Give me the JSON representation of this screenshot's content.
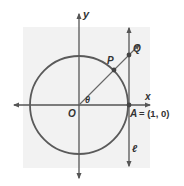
{
  "diagram": {
    "colors": {
      "panel": "#f2f2f2",
      "stroke": "#555555",
      "text": "#333333",
      "background": "#ffffff"
    },
    "labels": {
      "y_axis": "y",
      "x_axis": "x",
      "origin": "O",
      "angle": "θ",
      "point_p": "P",
      "point_q": "Q",
      "point_a": "A",
      "point_a_coords": "= (1, 0)",
      "tangent_line": "ℓ"
    },
    "elements": {
      "circle": {
        "center": [
          79,
          105
        ],
        "radius": 49
      },
      "x_axis": {
        "from": [
          12,
          105
        ],
        "to": [
          152,
          105
        ]
      },
      "y_axis": {
        "from": [
          79,
          180
        ],
        "to": [
          79,
          12
        ]
      },
      "tangent_line_l": {
        "x": 129,
        "from_y": 168,
        "to_y": 26
      },
      "ray_op": {
        "from": [
          79,
          105
        ],
        "to": [
          140,
          44
        ]
      },
      "points": {
        "P": [
          114,
          70
        ],
        "Q": [
          129,
          55
        ],
        "A": [
          129,
          105
        ]
      }
    }
  }
}
